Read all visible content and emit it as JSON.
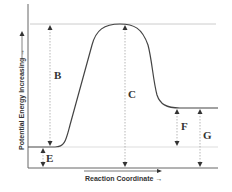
{
  "diagram": {
    "y_axis_label": "Potential Energy Increasing →",
    "x_axis_label": "Reaction Coordinate →",
    "labels": {
      "B": "B",
      "C": "C",
      "E": "E",
      "F": "F",
      "G": "G"
    },
    "colors": {
      "curve": "#444444",
      "axis": "#555555",
      "guide": "#cccccc",
      "text": "#333333"
    }
  }
}
